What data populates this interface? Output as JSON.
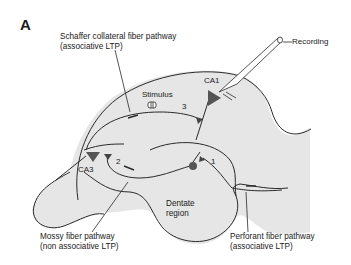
{
  "figure": {
    "panel_label": "A",
    "regions": {
      "ca1": "CA1",
      "ca3": "CA3",
      "dentate_line1": "Dentate",
      "dentate_line2": "region"
    },
    "stimulus_label": "Stimulus",
    "recording_label": "Recording",
    "synapse_numbers": [
      "1",
      "2",
      "3"
    ],
    "pathways": {
      "schaffer": {
        "line1": "Schaffer collateral fiber pathway",
        "line2": "(associative LTP)"
      },
      "mossy": {
        "line1": "Mossy fiber pathway",
        "line2": "(non associative LTP)"
      },
      "perforant": {
        "line1": "Perforant fiber pathway",
        "line2": "(associative LTP)"
      }
    },
    "colors": {
      "tissue_fill": "#e6e6e6",
      "outline": "#2a2a2a",
      "neuron_fill": "#555555"
    }
  }
}
